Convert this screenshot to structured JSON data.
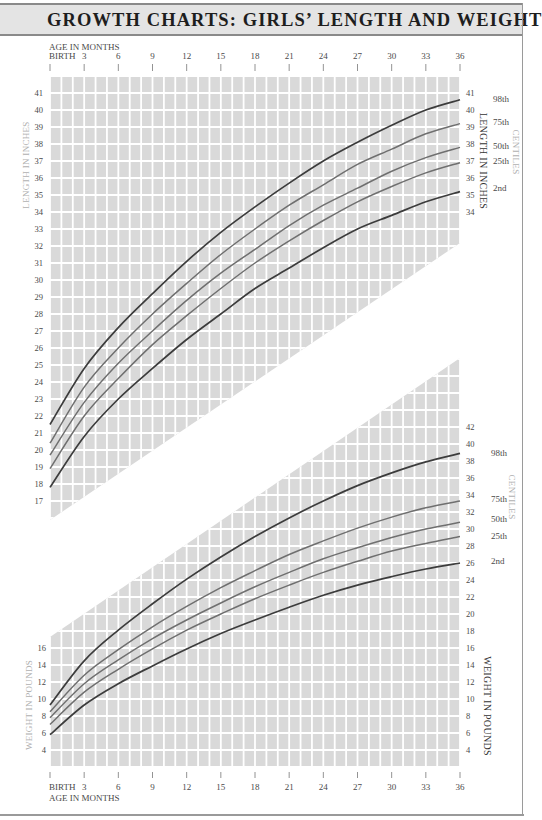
{
  "title": "GROWTH CHARTS: GIRLS’ LENGTH AND WEIGHT",
  "axis": {
    "top_label": "AGE IN MONTHS",
    "bottom_label": "AGE IN MONTHS",
    "ticks": [
      "BIRTH",
      "3",
      "6",
      "9",
      "12",
      "15",
      "18",
      "21",
      "24",
      "27",
      "30",
      "33",
      "36"
    ]
  },
  "length_chart": {
    "ylabel_left": "LENGTH IN INCHES",
    "ylabel_right": "LENGTH IN INCHES",
    "centiles_label": "CENTILES",
    "left_ticks": [
      17,
      18,
      19,
      20,
      21,
      22,
      23,
      24,
      25,
      26,
      27,
      28,
      29,
      30,
      31,
      32,
      33,
      34,
      35,
      36,
      37,
      38,
      39,
      40,
      41
    ],
    "right_ticks": [
      34,
      35,
      36,
      37,
      38,
      39,
      40,
      41
    ]
  },
  "weight_chart": {
    "ylabel_left": "WEIGHT IN POUNDS",
    "ylabel_right": "WEIGHT IN POUNDS",
    "centiles_label": "CENTILES",
    "left_ticks": [
      4,
      6,
      8,
      10,
      12,
      14,
      16
    ],
    "right_ticks": [
      4,
      6,
      8,
      10,
      12,
      14,
      16,
      18,
      20,
      22,
      24,
      26,
      28,
      30,
      32,
      34,
      36,
      38,
      40,
      42
    ]
  },
  "colors": {
    "grid_fill": "#d9d9d9",
    "grid_line": "#ffffff",
    "outer_centile": "#3c3c3c",
    "inner_centile": "#6f6f6f",
    "axis_text": "#4a4a4a",
    "faint_label": "#b0b0b0",
    "header_bg": "#e4e4e4"
  },
  "chart_data": [
    {
      "type": "line",
      "title": "Girls' Length",
      "xlabel": "AGE IN MONTHS",
      "ylabel": "LENGTH IN INCHES",
      "x": [
        0,
        3,
        6,
        9,
        12,
        15,
        18,
        21,
        24,
        27,
        30,
        33,
        36
      ],
      "xlim": [
        0,
        36
      ],
      "ylim": [
        17,
        41
      ],
      "grid": true,
      "legend_position": "right",
      "series": [
        {
          "name": "98th",
          "values": [
            21.5,
            24.8,
            27.2,
            29.2,
            31.1,
            32.8,
            34.3,
            35.7,
            37.0,
            38.1,
            39.1,
            40.0,
            40.6
          ]
        },
        {
          "name": "75th",
          "values": [
            20.4,
            23.7,
            26.0,
            28.0,
            29.8,
            31.5,
            33.0,
            34.4,
            35.6,
            36.8,
            37.7,
            38.6,
            39.2
          ]
        },
        {
          "name": "50th",
          "values": [
            19.7,
            22.8,
            25.1,
            27.0,
            28.8,
            30.4,
            31.8,
            33.2,
            34.4,
            35.4,
            36.4,
            37.2,
            37.8
          ]
        },
        {
          "name": "25th",
          "values": [
            18.9,
            22.0,
            24.2,
            26.2,
            27.9,
            29.5,
            31.0,
            32.3,
            33.5,
            34.6,
            35.5,
            36.3,
            36.9
          ]
        },
        {
          "name": "2nd",
          "values": [
            17.8,
            20.8,
            23.0,
            24.8,
            26.5,
            28.0,
            29.5,
            30.7,
            31.9,
            33.0,
            33.8,
            34.6,
            35.2
          ]
        }
      ]
    },
    {
      "type": "line",
      "title": "Girls' Weight",
      "xlabel": "AGE IN MONTHS",
      "ylabel": "WEIGHT IN POUNDS",
      "x": [
        0,
        3,
        6,
        9,
        12,
        15,
        18,
        21,
        24,
        27,
        30,
        33,
        36
      ],
      "xlim": [
        0,
        36
      ],
      "ylim": [
        4,
        42
      ],
      "grid": true,
      "legend_position": "right",
      "series": [
        {
          "name": "98th",
          "values": [
            9.3,
            14.5,
            18.1,
            21.2,
            24.1,
            26.7,
            29.1,
            31.3,
            33.3,
            35.1,
            36.6,
            37.9,
            38.9
          ]
        },
        {
          "name": "75th",
          "values": [
            8.5,
            12.8,
            15.8,
            18.5,
            20.9,
            23.1,
            25.1,
            27.0,
            28.6,
            30.1,
            31.4,
            32.5,
            33.3
          ]
        },
        {
          "name": "50th",
          "values": [
            7.8,
            11.8,
            14.6,
            17.1,
            19.3,
            21.3,
            23.2,
            24.9,
            26.5,
            27.8,
            29.0,
            30.0,
            30.8
          ]
        },
        {
          "name": "25th",
          "values": [
            7.0,
            10.8,
            13.5,
            15.9,
            18.1,
            20.0,
            21.8,
            23.4,
            24.9,
            26.2,
            27.4,
            28.3,
            29.1
          ]
        },
        {
          "name": "2nd",
          "values": [
            5.8,
            9.3,
            11.8,
            13.9,
            15.9,
            17.7,
            19.3,
            20.8,
            22.2,
            23.4,
            24.4,
            25.3,
            26.0
          ]
        }
      ]
    }
  ]
}
